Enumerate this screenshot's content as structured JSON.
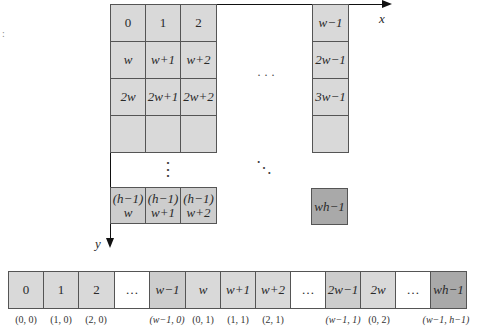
{
  "figure": {
    "axes": {
      "x_label": "x",
      "y_label": "y"
    },
    "grid": {
      "rows": [
        [
          "0",
          "1",
          "2",
          "w−1"
        ],
        [
          "w",
          "w+1",
          "w+2",
          "2w−1"
        ],
        [
          "2w",
          "2w+1",
          "2w+2",
          "3w−1"
        ],
        [
          "",
          "",
          "",
          ""
        ]
      ],
      "last_row": [
        {
          "line1": "(h−1)",
          "line2": "w"
        },
        {
          "line1": "(h−1)",
          "line2": "w+1"
        },
        {
          "line1": "(h−1)",
          "line2": "w+2"
        }
      ],
      "last_cell": "wh−1",
      "ellipsis_horizontal": "· · ·",
      "ellipsis_vertical": "⋮",
      "ellipsis_diagonal": "⋱"
    },
    "strip": {
      "cells": [
        "0",
        "1",
        "2",
        "…",
        "w−1",
        "w",
        "w+1",
        "w+2",
        "…",
        "2w−1",
        "2w",
        "…",
        "wh−1"
      ],
      "coords": [
        "(0, 0)",
        "(1, 0)",
        "(2, 0)",
        "",
        "(w−1, 0)",
        "(0, 1)",
        "(1, 1)",
        "(2, 1)",
        "",
        "(w−1, 1)",
        "(0, 2)",
        "",
        "(w−1, h−1)"
      ]
    },
    "colors": {
      "cell_light": "#d9d9d9",
      "cell_mid": "#cdcdcd",
      "cell_dark": "#a9a9a9",
      "border": "#555555"
    }
  }
}
